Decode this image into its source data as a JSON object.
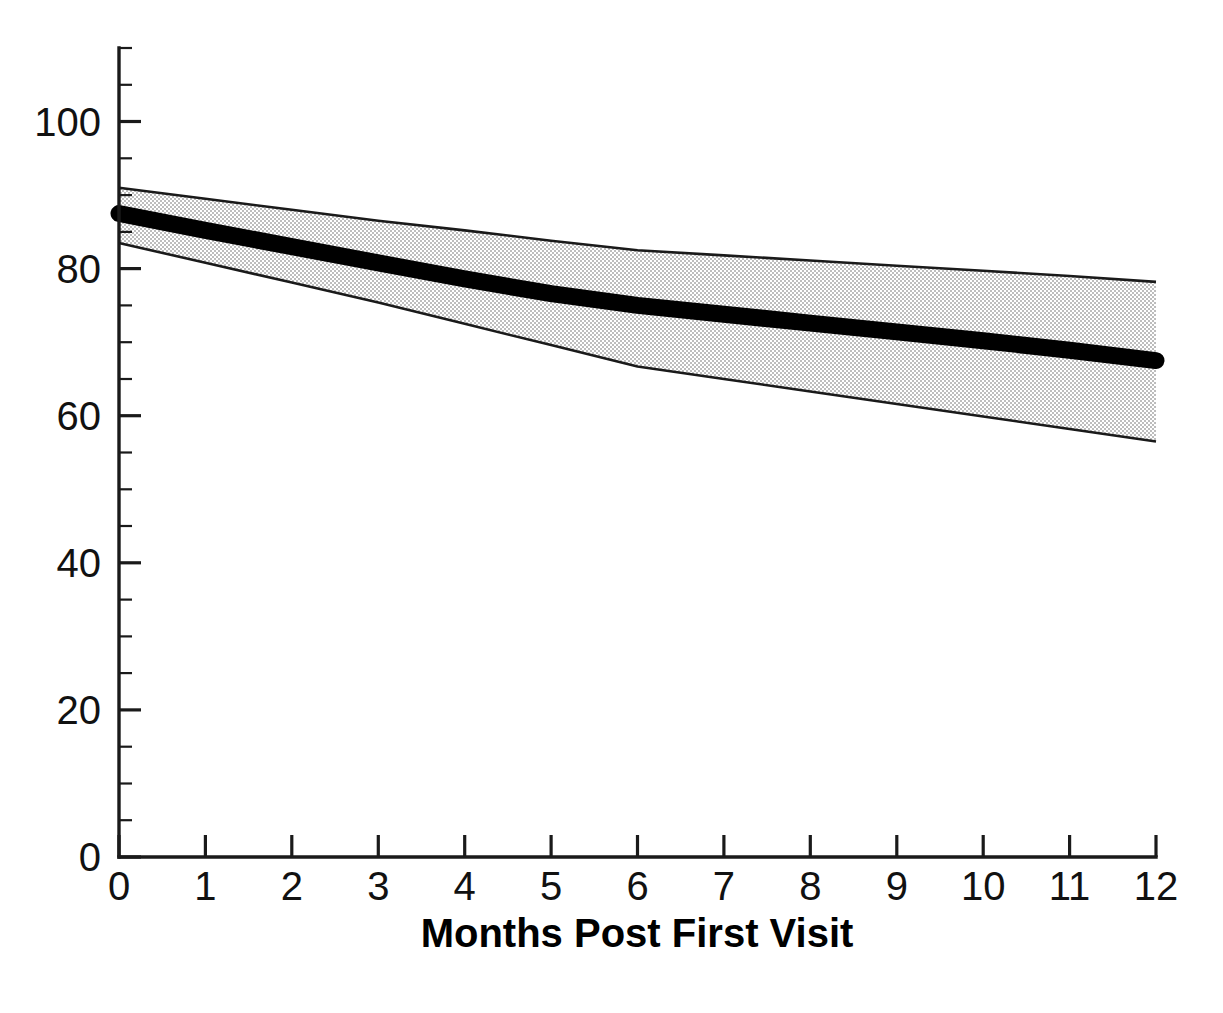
{
  "chart_data": {
    "type": "line",
    "title": "",
    "subtitle": "",
    "xlabel": "Months Post First Visit",
    "ylabel": "",
    "xlim": [
      0,
      12
    ],
    "ylim": [
      0,
      110
    ],
    "grid": false,
    "legend": null,
    "x": [
      0,
      1,
      2,
      3,
      4,
      5,
      6,
      7,
      8,
      9,
      10,
      11,
      12
    ],
    "series": [
      {
        "name": "Mean estimate",
        "style": "thick-black-line",
        "values": [
          87.5,
          85.2,
          83.0,
          80.8,
          78.6,
          76.6,
          75.0,
          73.8,
          72.6,
          71.4,
          70.2,
          68.9,
          67.5
        ]
      },
      {
        "name": "Upper confidence bound",
        "style": "shaded-band-edge",
        "values": [
          91.0,
          89.5,
          88.0,
          86.5,
          85.2,
          83.8,
          82.5,
          81.8,
          81.1,
          80.4,
          79.7,
          79.0,
          78.2
        ]
      },
      {
        "name": "Lower confidence bound",
        "style": "shaded-band-edge",
        "values": [
          83.5,
          80.8,
          78.1,
          75.4,
          72.5,
          69.6,
          66.7,
          65.0,
          63.3,
          61.6,
          59.9,
          58.2,
          56.5
        ]
      }
    ],
    "band": {
      "name": "Confidence interval",
      "fill_color": "#d9d9d9",
      "edge_color": "#1a1a1a"
    },
    "annotations": [],
    "x_tick_labels": [
      "0",
      "1",
      "2",
      "3",
      "4",
      "5",
      "6",
      "7",
      "8",
      "9",
      "10",
      "11",
      "12"
    ],
    "y_tick_labels": [
      "0",
      "20",
      "40",
      "60",
      "80",
      "100"
    ],
    "y_tick_values": [
      0,
      20,
      40,
      60,
      80,
      100
    ],
    "y_minor_step": 5,
    "line_color": "#000000"
  },
  "axes": {
    "x_title": "Months Post First Visit",
    "y_title": ""
  }
}
